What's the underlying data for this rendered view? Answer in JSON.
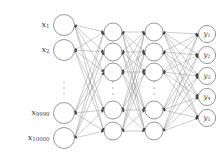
{
  "figure": {
    "type": "neural-network-diagram",
    "title": "",
    "background_color": "#ffffff",
    "node_stroke_color": "#8c8c8c",
    "node_fill_color": "#ffffff",
    "edge_color": "#8c8c8c",
    "arrowhead_color": "#3a3a3a",
    "label_color": "#3c3c3c",
    "ellipsis_color": "#9a9a9a",
    "canvas": {
      "width": 223,
      "height": 160
    }
  },
  "layers": [
    {
      "id": "input-layer",
      "name": "input-layer",
      "x": 64,
      "node_radius": 10.5,
      "has_ellipsis": true,
      "ellipsis_y": 88,
      "nodes": [
        {
          "id": "x1",
          "cy": 25,
          "label": "x",
          "sub": "1",
          "label_text": "x1"
        },
        {
          "id": "x2",
          "cy": 50,
          "label": "x",
          "sub": "2",
          "label_text": "x2"
        },
        {
          "id": "x9999",
          "cy": 113,
          "label": "x",
          "sub": "9999",
          "label_text": "x9999"
        },
        {
          "id": "x10000",
          "cy": 138,
          "label": "x",
          "sub": "10000",
          "label_text": "x10000"
        }
      ]
    },
    {
      "id": "hidden-layer-1",
      "name": "hidden-layer-1",
      "x": 113,
      "node_radius": 9.0,
      "has_ellipsis": true,
      "ellipsis_y": 88,
      "nodes": [
        {
          "id": "h1-1",
          "cy": 32,
          "label": "",
          "sub": "",
          "label_text": ""
        },
        {
          "id": "h1-2",
          "cy": 52,
          "label": "",
          "sub": "",
          "label_text": ""
        },
        {
          "id": "h1-3",
          "cy": 72,
          "label": "",
          "sub": "",
          "label_text": ""
        },
        {
          "id": "h1-4",
          "cy": 110,
          "label": "",
          "sub": "",
          "label_text": ""
        },
        {
          "id": "h1-5",
          "cy": 131,
          "label": "",
          "sub": "",
          "label_text": ""
        }
      ]
    },
    {
      "id": "hidden-layer-2",
      "name": "hidden-layer-2",
      "x": 154,
      "node_radius": 9.0,
      "has_ellipsis": true,
      "ellipsis_y": 88,
      "nodes": [
        {
          "id": "h2-1",
          "cy": 32,
          "label": "",
          "sub": "",
          "label_text": ""
        },
        {
          "id": "h2-2",
          "cy": 52,
          "label": "",
          "sub": "",
          "label_text": ""
        },
        {
          "id": "h2-3",
          "cy": 72,
          "label": "",
          "sub": "",
          "label_text": ""
        },
        {
          "id": "h2-4",
          "cy": 110,
          "label": "",
          "sub": "",
          "label_text": ""
        },
        {
          "id": "h2-5",
          "cy": 131,
          "label": "",
          "sub": "",
          "label_text": ""
        }
      ]
    },
    {
      "id": "output-layer",
      "name": "output-layer",
      "x": 207,
      "node_radius": 8.6,
      "has_ellipsis": false,
      "ellipsis_y": 0,
      "nodes": [
        {
          "id": "y1",
          "cy": 34,
          "label": "y",
          "sub": "1",
          "label_text": "y1"
        },
        {
          "id": "y2",
          "cy": 55,
          "label": "y",
          "sub": "2",
          "label_text": "y2"
        },
        {
          "id": "y3",
          "cy": 76,
          "label": "y",
          "sub": "3",
          "label_text": "y3"
        },
        {
          "id": "y4",
          "cy": 97,
          "label": "y",
          "sub": "4",
          "label_text": "y4"
        },
        {
          "id": "y5",
          "cy": 118,
          "label": "y",
          "sub": "5",
          "label_text": "y5"
        }
      ]
    }
  ],
  "connections": {
    "fully_connected": true,
    "description": "every node of each layer connects to every node of the next layer",
    "arrow_direction": "both-ends"
  }
}
